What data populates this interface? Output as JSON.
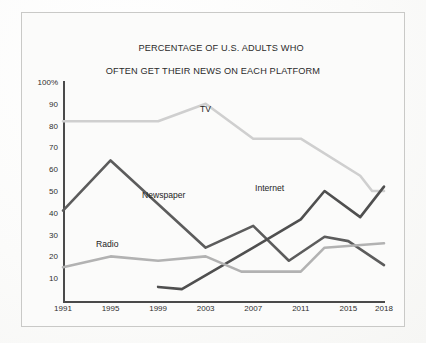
{
  "title": {
    "line1": "PERCENTAGE OF U.S. ADULTS WHO",
    "line2": "OFTEN GET THEIR NEWS ON EACH PLATFORM"
  },
  "axis": {
    "y_ticks": [
      "100%",
      "90",
      "80",
      "70",
      "60",
      "50",
      "40",
      "30",
      "20",
      "10"
    ],
    "x_ticks": [
      "1991",
      "1995",
      "1999",
      "2003",
      "2007",
      "2011",
      "2015",
      "2018"
    ]
  },
  "series_labels": {
    "tv": "TV",
    "newspaper": "Newspaper",
    "internet": "Internet",
    "radio": "Radio"
  },
  "colors": {
    "tv": "#cfcfcf",
    "radio": "#b2b2b2",
    "newspaper": "#5c5c5c",
    "internet": "#4f4f4f",
    "axis": "#4a4a4a",
    "frame": "#c9c9c7",
    "background": "#fbfbfa",
    "text": "#2b2b2b"
  },
  "chart_data": {
    "type": "line",
    "title": "PERCENTAGE OF U.S. ADULTS WHO OFTEN GET THEIR NEWS ON EACH PLATFORM",
    "xlabel": "",
    "ylabel": "",
    "xlim": [
      1991,
      2018
    ],
    "ylim": [
      0,
      100
    ],
    "ytick_values": [
      100,
      90,
      80,
      70,
      60,
      50,
      40,
      30,
      20,
      10
    ],
    "xtick_values": [
      1991,
      1995,
      1999,
      2003,
      2007,
      2011,
      2015,
      2018
    ],
    "grid": false,
    "legend": "inline-labels",
    "series": [
      {
        "name": "TV",
        "color": "#cfcfcf",
        "points": [
          {
            "x": 1991,
            "y": 82
          },
          {
            "x": 1995,
            "y": 82
          },
          {
            "x": 1999,
            "y": 82
          },
          {
            "x": 2003,
            "y": 90
          },
          {
            "x": 2007,
            "y": 74
          },
          {
            "x": 2011,
            "y": 74
          },
          {
            "x": 2016,
            "y": 57
          },
          {
            "x": 2017,
            "y": 50
          },
          {
            "x": 2018,
            "y": 50
          }
        ]
      },
      {
        "name": "Newspaper",
        "color": "#5c5c5c",
        "points": [
          {
            "x": 1991,
            "y": 41
          },
          {
            "x": 1995,
            "y": 64
          },
          {
            "x": 2003,
            "y": 24
          },
          {
            "x": 2007,
            "y": 34
          },
          {
            "x": 2010,
            "y": 18
          },
          {
            "x": 2013,
            "y": 29
          },
          {
            "x": 2015,
            "y": 27
          },
          {
            "x": 2018,
            "y": 16
          }
        ]
      },
      {
        "name": "Internet",
        "color": "#4f4f4f",
        "points": [
          {
            "x": 1999,
            "y": 6
          },
          {
            "x": 2001,
            "y": 5
          },
          {
            "x": 2007,
            "y": 24
          },
          {
            "x": 2011,
            "y": 37
          },
          {
            "x": 2013,
            "y": 50
          },
          {
            "x": 2016,
            "y": 38
          },
          {
            "x": 2018,
            "y": 52
          }
        ]
      },
      {
        "name": "Radio",
        "color": "#b2b2b2",
        "points": [
          {
            "x": 1991,
            "y": 15
          },
          {
            "x": 1995,
            "y": 20
          },
          {
            "x": 1999,
            "y": 18
          },
          {
            "x": 2003,
            "y": 20
          },
          {
            "x": 2006,
            "y": 13
          },
          {
            "x": 2011,
            "y": 13
          },
          {
            "x": 2013,
            "y": 24
          },
          {
            "x": 2018,
            "y": 26
          }
        ]
      }
    ]
  }
}
